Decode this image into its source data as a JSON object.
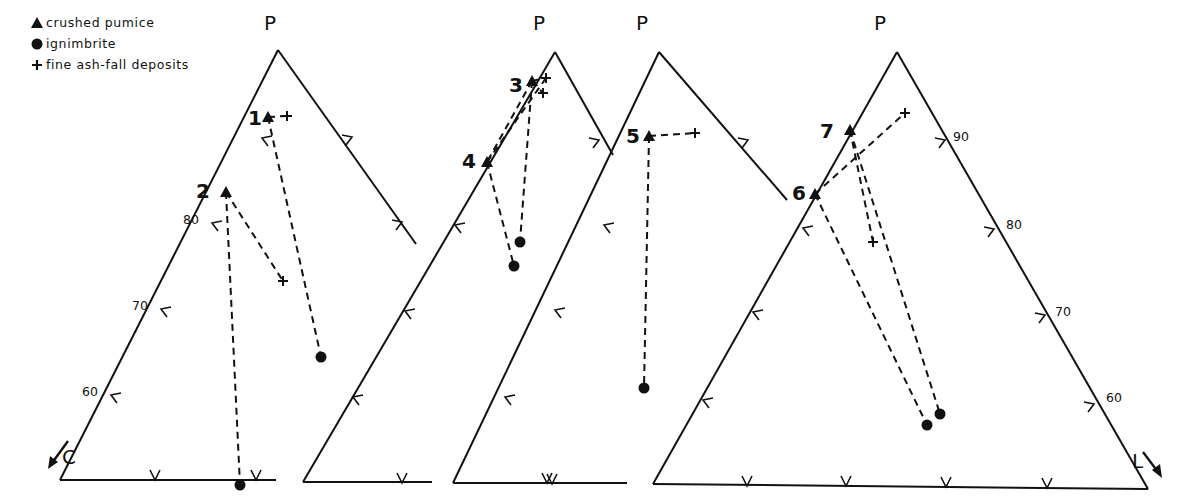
{
  "legend": {
    "items": [
      {
        "symbol": "triangle",
        "label": "crushed pumice"
      },
      {
        "symbol": "circle",
        "label": "ignimbrite"
      },
      {
        "symbol": "plus",
        "label": "fine ash-fall deposits"
      }
    ]
  },
  "chart_data": {
    "type": "ternary-diagram",
    "title": "",
    "axes": {
      "apex": "P",
      "left": "C",
      "right": "L"
    },
    "left_axis_ticks": [
      "80",
      "70",
      "60"
    ],
    "right_axis_ticks": [
      "90",
      "80",
      "70",
      "60"
    ],
    "series": [
      {
        "name": "crushed pumice",
        "marker": "triangle"
      },
      {
        "name": "ignimbrite",
        "marker": "circle"
      },
      {
        "name": "fine ash-fall deposits",
        "marker": "plus"
      }
    ],
    "samples": [
      {
        "id": "1",
        "pumice": [
          268,
          117
        ],
        "ignimbrite": [
          [
            321,
            357
          ]
        ],
        "ashfall": [
          [
            287,
            116
          ]
        ]
      },
      {
        "id": "2",
        "pumice": [
          226,
          192
        ],
        "ignimbrite": [
          [
            240,
            485
          ]
        ],
        "ashfall": [
          [
            283,
            281
          ]
        ]
      },
      {
        "id": "3",
        "pumice": [
          532,
          81
        ],
        "ignimbrite": [
          [
            520,
            242
          ]
        ],
        "ashfall": [
          [
            546,
            78
          ],
          [
            543,
            93
          ]
        ]
      },
      {
        "id": "4",
        "pumice": [
          487,
          162
        ],
        "ignimbrite": [
          [
            514,
            266
          ]
        ],
        "ashfall": []
      },
      {
        "id": "5",
        "pumice": [
          649,
          136
        ],
        "ignimbrite": [
          [
            644,
            388
          ]
        ],
        "ashfall": [
          [
            695,
            133
          ]
        ]
      },
      {
        "id": "6",
        "pumice": [
          815,
          194
        ],
        "ignimbrite": [
          [
            927,
            425
          ]
        ],
        "ashfall": [
          [
            905,
            113
          ]
        ]
      },
      {
        "id": "7",
        "pumice": [
          850,
          130
        ],
        "ignimbrite": [
          [
            940,
            414
          ]
        ],
        "ashfall": [
          [
            873,
            242
          ]
        ]
      }
    ]
  },
  "diagram": {
    "triangles": [
      {
        "apex": [
          278,
          50
        ],
        "left_end": [
          60,
          480
        ],
        "right_end": [
          416,
          244
        ],
        "base_end": [
          276,
          480
        ],
        "apex_label": "P"
      },
      {
        "apex": [
          555,
          52
        ],
        "left_end": [
          303,
          482
        ],
        "right_end": [
          613,
          155
        ],
        "base_end": [
          425,
          482
        ],
        "apex_label": "P"
      },
      {
        "apex": [
          659,
          52
        ],
        "left_end": [
          453,
          483
        ],
        "right_end": [
          787,
          200
        ],
        "base_end": [
          627,
          483
        ],
        "apex_label": "P"
      },
      {
        "apex": [
          897,
          52
        ],
        "left_end": [
          653,
          484
        ],
        "right_end": [
          1148,
          489
        ],
        "base_end": [
          1148,
          489
        ],
        "apex_label": "P"
      }
    ],
    "labels": {
      "C": "C",
      "L": "L"
    }
  }
}
